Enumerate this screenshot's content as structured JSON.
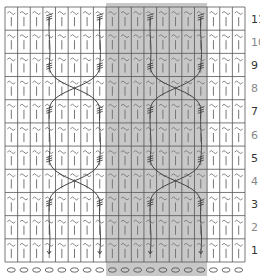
{
  "chart_data": {
    "type": "table",
    "title": "",
    "columns": 19,
    "rows": 11,
    "row_labels": [
      "11",
      "10",
      "9",
      "8",
      "7",
      "6",
      "5",
      "4",
      "3",
      "2",
      "1"
    ],
    "odd_row_label_color": "#333333",
    "even_row_label_color": "#888888",
    "cell_symbols": {
      "top": "~",
      "bottom": "|"
    },
    "repeat_region": {
      "start_col": 9,
      "end_col": 16,
      "color": "#c8c8c8"
    },
    "cast_on_symbol": "o",
    "cables": [
      {
        "name": "left-cable",
        "strand_cols": [
          4,
          8
        ],
        "crossings_between_rows": [
          [
            3,
            5
          ],
          [
            7,
            9
          ]
        ]
      },
      {
        "name": "right-cable",
        "strand_cols": [
          12,
          16
        ],
        "crossings_between_rows": [
          [
            3,
            5
          ],
          [
            7,
            9
          ]
        ]
      }
    ],
    "grid_color": "#555555",
    "symbol_color": "#777777",
    "cable_color": "#444444"
  },
  "grid": {
    "x0": 5,
    "y0": 7,
    "width": 240,
    "height": 255
  }
}
